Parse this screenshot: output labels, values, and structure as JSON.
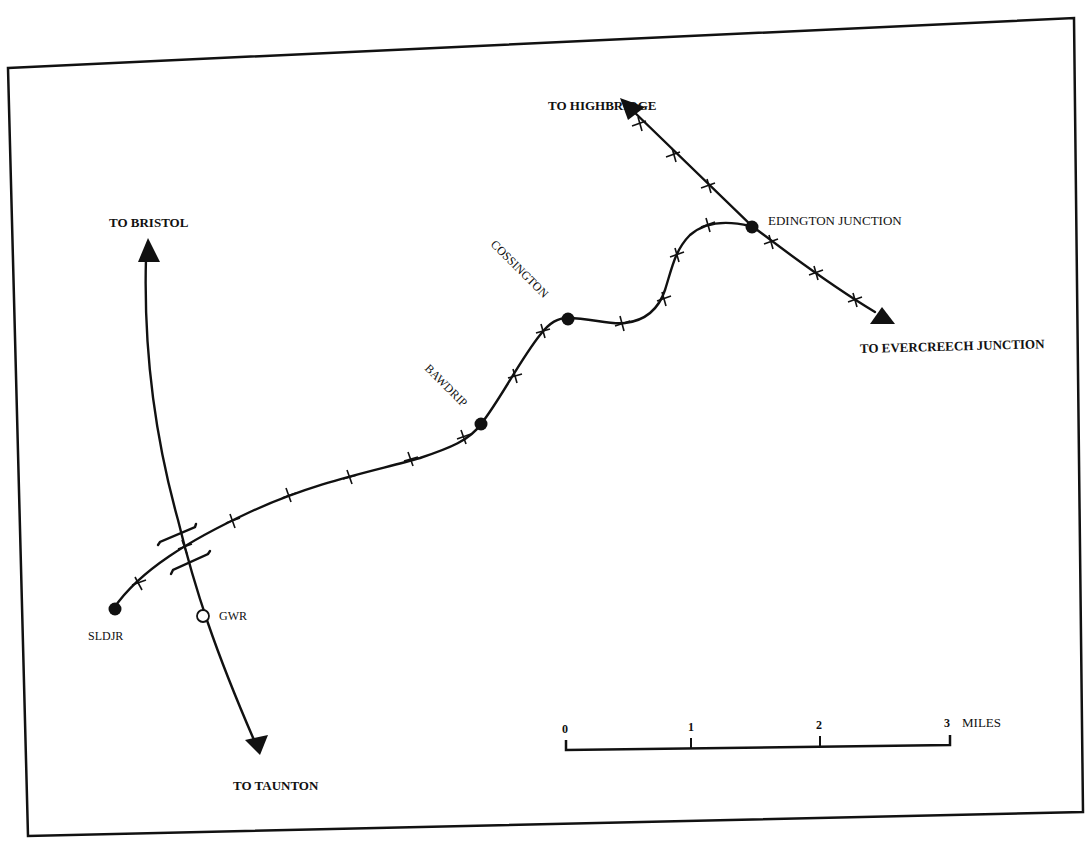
{
  "map": {
    "destinations": {
      "highbridge": "TO HIGHBRIDGE",
      "bristol": "TO BRISTOL",
      "evercreech": "TO EVERCREECH JUNCTION",
      "taunton": "TO TAUNTON"
    },
    "stations": {
      "edington": "EDINGTON JUNCTION",
      "cossington": "COSSINGTON",
      "bawdrip": "BAWDRIP",
      "sldjr": "SLDJR",
      "gwr": "GWR"
    },
    "scale_bar": {
      "ticks": [
        "0",
        "1",
        "2",
        "3"
      ],
      "unit": "MILES"
    },
    "colors": {
      "ink": "#111111",
      "paper": "#ffffff"
    }
  }
}
